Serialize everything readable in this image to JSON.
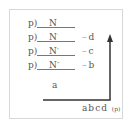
{
  "diagram": {
    "rows": [
      {
        "prefix": "p)",
        "symbol": "N",
        "prime": "",
        "label": ""
      },
      {
        "prefix": "p)",
        "symbol": "N",
        "prime": "′",
        "label": "d"
      },
      {
        "prefix": "p)",
        "symbol": "N",
        "prime": "″",
        "label": "c"
      },
      {
        "prefix": "p)",
        "symbol": "N",
        "prime": "‴",
        "label": "b"
      }
    ],
    "dots": "···",
    "bottom_label": "a",
    "axis_label": "abcd",
    "axis_unit": "(p)",
    "colors": {
      "line": "#333333",
      "text": "#555555",
      "frame": "#d8d8d8"
    }
  }
}
